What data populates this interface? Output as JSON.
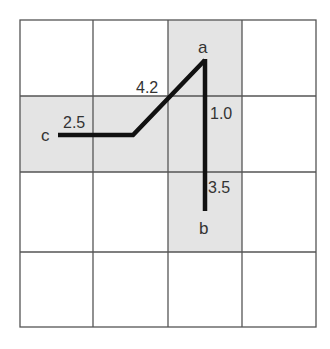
{
  "diagram": {
    "grid": {
      "rows": 4,
      "cols": 4,
      "line_color": "#555555",
      "shade_color": "#e4e4e4"
    },
    "shaded_cells": [
      {
        "row": 0,
        "col": 2
      },
      {
        "row": 1,
        "col": 0
      },
      {
        "row": 1,
        "col": 1
      },
      {
        "row": 1,
        "col": 2
      },
      {
        "row": 2,
        "col": 2
      }
    ],
    "points": {
      "a": "a",
      "b": "b",
      "c": "c"
    },
    "segment_labels": {
      "c_segment": "2.5",
      "diagonal": "4.2",
      "a_upper": "1.0",
      "a_lower": "3.5"
    },
    "path_color": "#111111"
  }
}
